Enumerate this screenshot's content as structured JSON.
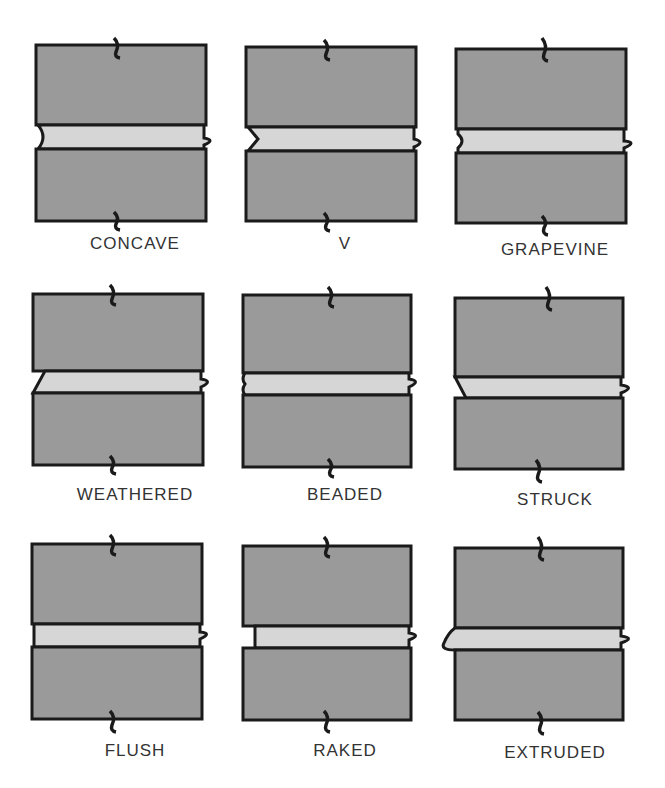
{
  "colors": {
    "brick": "#9a9a9a",
    "mortar": "#d6d6d6",
    "outline": "#1a1a1a",
    "label": "#333333"
  },
  "joints": [
    {
      "id": "concave",
      "label": "CONCAVE",
      "row": 0,
      "col": 0,
      "profile": "concave"
    },
    {
      "id": "v",
      "label": "V",
      "row": 0,
      "col": 1,
      "profile": "v"
    },
    {
      "id": "grapevine",
      "label": "GRAPEVINE",
      "row": 0,
      "col": 2,
      "profile": "grapevine"
    },
    {
      "id": "weathered",
      "label": "WEATHERED",
      "row": 1,
      "col": 0,
      "profile": "weathered"
    },
    {
      "id": "beaded",
      "label": "BEADED",
      "row": 1,
      "col": 1,
      "profile": "beaded"
    },
    {
      "id": "struck",
      "label": "STRUCK",
      "row": 1,
      "col": 2,
      "profile": "struck"
    },
    {
      "id": "flush",
      "label": "FLUSH",
      "row": 2,
      "col": 0,
      "profile": "flush"
    },
    {
      "id": "raked",
      "label": "RAKED",
      "row": 2,
      "col": 1,
      "profile": "raked"
    },
    {
      "id": "extruded",
      "label": "EXTRUDED",
      "row": 2,
      "col": 2,
      "profile": "extruded"
    }
  ]
}
